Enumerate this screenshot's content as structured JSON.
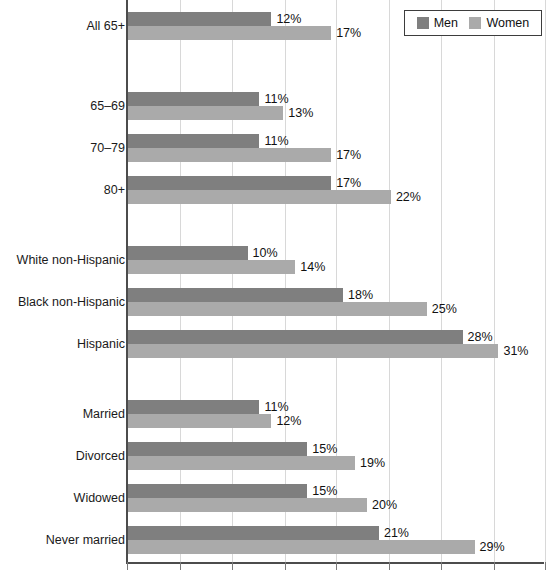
{
  "chart_data": {
    "type": "bar",
    "orientation": "horizontal",
    "title": "",
    "subtitle": "",
    "xlabel": "",
    "ylabel": "",
    "xlim": [
      0,
      35
    ],
    "grid": true,
    "gridline_values": [
      0,
      4.4,
      8.8,
      13.2,
      17.5,
      21.9,
      26.3,
      30.7,
      35.0
    ],
    "value_suffix": "%",
    "legend": {
      "position": "top-right",
      "entries": [
        {
          "name": "Men",
          "color": "#7f7f7f"
        },
        {
          "name": "Women",
          "color": "#aaaaaa"
        }
      ]
    },
    "series": [
      {
        "name": "Men",
        "color": "#7f7f7f",
        "values": [
          12,
          11,
          11,
          17,
          10,
          18,
          28,
          11,
          15,
          15,
          21
        ]
      },
      {
        "name": "Women",
        "color": "#aaaaaa",
        "values": [
          17,
          13,
          17,
          22,
          14,
          25,
          31,
          12,
          19,
          20,
          29
        ]
      }
    ],
    "categories": [
      "All 65+",
      "65–69",
      "70–79",
      "80+",
      "White non-Hispanic",
      "Black non-Hispanic",
      "Hispanic",
      "Married",
      "Divorced",
      "Widowed",
      "Never married"
    ],
    "groups": [
      {
        "group_name": "overall",
        "rows": [
          {
            "label": "All 65+",
            "men": 12,
            "women": 17,
            "men_text": "12%",
            "women_text": "17%"
          }
        ]
      },
      {
        "group_name": "age",
        "rows": [
          {
            "label": "65–69",
            "men": 11,
            "women": 13,
            "men_text": "11%",
            "women_text": "13%"
          },
          {
            "label": "70–79",
            "men": 11,
            "women": 17,
            "men_text": "11%",
            "women_text": "17%"
          },
          {
            "label": "80+",
            "men": 17,
            "women": 22,
            "men_text": "17%",
            "women_text": "22%"
          }
        ]
      },
      {
        "group_name": "race-ethnicity",
        "rows": [
          {
            "label": "White non-Hispanic",
            "men": 10,
            "women": 14,
            "men_text": "10%",
            "women_text": "14%"
          },
          {
            "label": "Black non-Hispanic",
            "men": 18,
            "women": 25,
            "men_text": "18%",
            "women_text": "25%"
          },
          {
            "label": "Hispanic",
            "men": 28,
            "women": 31,
            "men_text": "28%",
            "women_text": "31%"
          }
        ]
      },
      {
        "group_name": "marital-status",
        "rows": [
          {
            "label": "Married",
            "men": 11,
            "women": 12,
            "men_text": "11%",
            "women_text": "12%"
          },
          {
            "label": "Divorced",
            "men": 15,
            "women": 19,
            "men_text": "15%",
            "women_text": "19%"
          },
          {
            "label": "Widowed",
            "men": 15,
            "women": 20,
            "men_text": "15%",
            "women_text": "20%"
          },
          {
            "label": "Never married",
            "men": 21,
            "women": 29,
            "men_text": "21%",
            "women_text": "29%"
          }
        ]
      }
    ]
  },
  "layout": {
    "axis_x_px": 127,
    "px_per_percent": 11.95,
    "bar_height_px": 14,
    "row_tops": [
      12,
      92,
      134,
      176,
      246,
      288,
      330,
      400,
      442,
      484,
      526
    ]
  },
  "colors": {
    "men": "#7f7f7f",
    "women": "#aaaaaa",
    "grid": "#d8d8d8",
    "axis": "#4c4c4c",
    "text": "#111111",
    "background": "#ffffff"
  }
}
